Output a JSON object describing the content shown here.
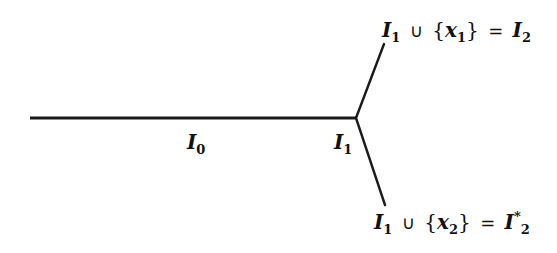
{
  "diagram": {
    "colors": {
      "line": "#1a1a1a",
      "text": "#111111",
      "background": "#ffffff"
    },
    "edges": [
      {
        "id": "trunk",
        "from": [
          30,
          118
        ],
        "to": [
          356,
          118
        ]
      },
      {
        "id": "upper-branch",
        "from": [
          356,
          118
        ],
        "to": [
          384,
          44
        ]
      },
      {
        "id": "lower-branch",
        "from": [
          356,
          118
        ],
        "to": [
          385,
          205
        ]
      }
    ],
    "labels": {
      "i0": {
        "base": "I",
        "sub": "0"
      },
      "i1": {
        "base": "I",
        "sub": "1"
      },
      "upper": {
        "lhs_base": "I",
        "lhs_sub": "1",
        "union": "∪",
        "open": "{",
        "var": "x",
        "var_sub": "1",
        "close": "}",
        "eq": "=",
        "rhs_base": "I",
        "rhs_sub": "2"
      },
      "lower": {
        "lhs_base": "I",
        "lhs_sub": "1",
        "union": "∪",
        "open": "{",
        "var": "x",
        "var_sub": "2",
        "close": "}",
        "eq": "=",
        "rhs_base": "I",
        "rhs_sup": "*",
        "rhs_sub": "2"
      }
    }
  }
}
